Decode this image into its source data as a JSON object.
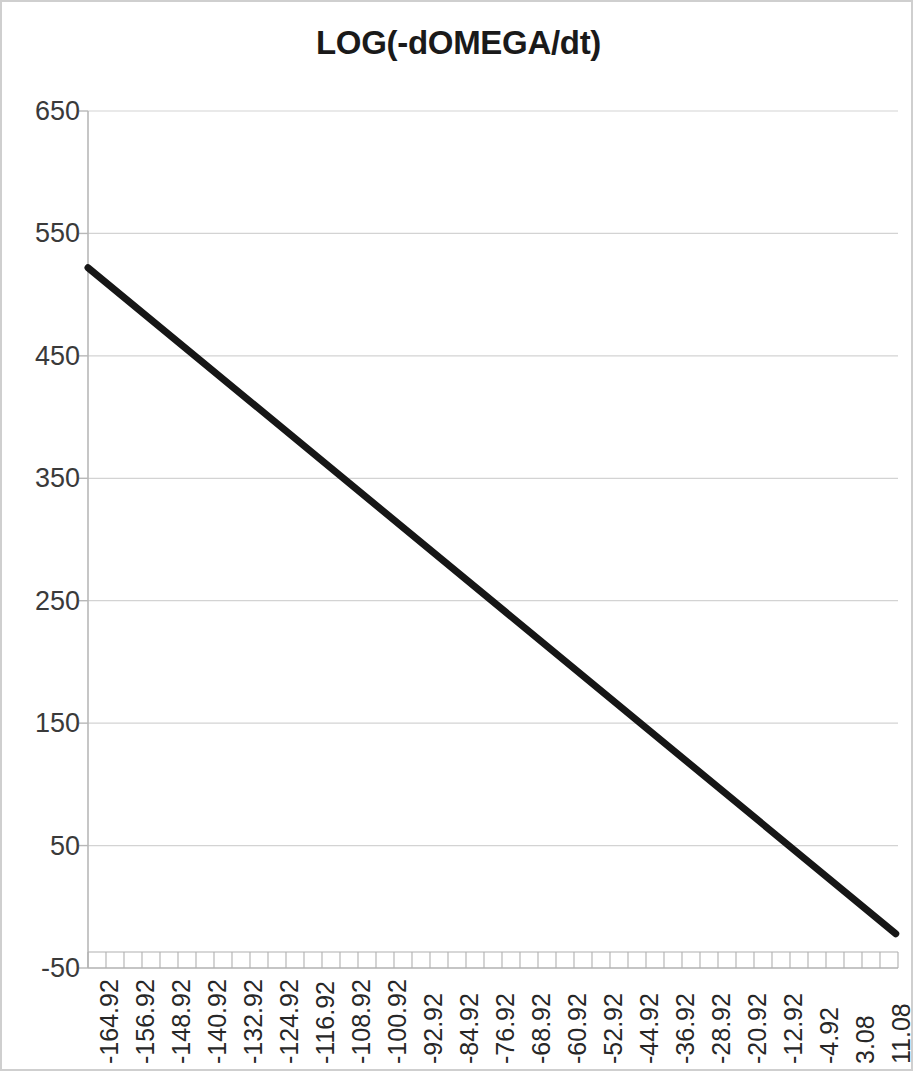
{
  "chart_data": {
    "type": "line",
    "title": "LOG(-dOMEGA/dt)",
    "xlabel": "",
    "ylabel": "",
    "grid": true,
    "legend": false,
    "ylim": [
      -50,
      650
    ],
    "ytick_labels": [
      "650",
      "550",
      "450",
      "350",
      "250",
      "150",
      "50",
      "-50"
    ],
    "yticks": [
      650,
      550,
      450,
      350,
      250,
      150,
      50,
      -50
    ],
    "xlim": [
      -164.92,
      15.08
    ],
    "xtick_labels": [
      "-164.92",
      "-156.92",
      "-148.92",
      "-140.92",
      "-132.92",
      "-124.92",
      "-116.92",
      "-108.92",
      "-100.92",
      "-92.92",
      "-84.92",
      "-76.92",
      "-68.92",
      "-60.92",
      "-52.92",
      "-44.92",
      "-36.92",
      "-28.92",
      "-20.92",
      "-12.92",
      "-4.92",
      "3.08",
      "11.08"
    ],
    "xticks": [
      -164.92,
      -156.92,
      -148.92,
      -140.92,
      -132.92,
      -124.92,
      -116.92,
      -108.92,
      -100.92,
      -92.92,
      -84.92,
      -76.92,
      -68.92,
      -60.92,
      -52.92,
      -44.92,
      -36.92,
      -28.92,
      -20.92,
      -12.92,
      -4.92,
      3.08,
      11.08
    ],
    "minor_tick_count": 45,
    "series": [
      {
        "name": "LOG(-dOMEGA/dt)",
        "color": "#161616",
        "line_width": 7,
        "x": [
          -164.92,
          14.58
        ],
        "values": [
          522,
          -22
        ]
      }
    ],
    "line_color": "#161616",
    "grid_color": "#d3d3d3",
    "axis_color": "#b8b8b8",
    "background": "#ffffff",
    "border_color": "#cfcfcf"
  }
}
